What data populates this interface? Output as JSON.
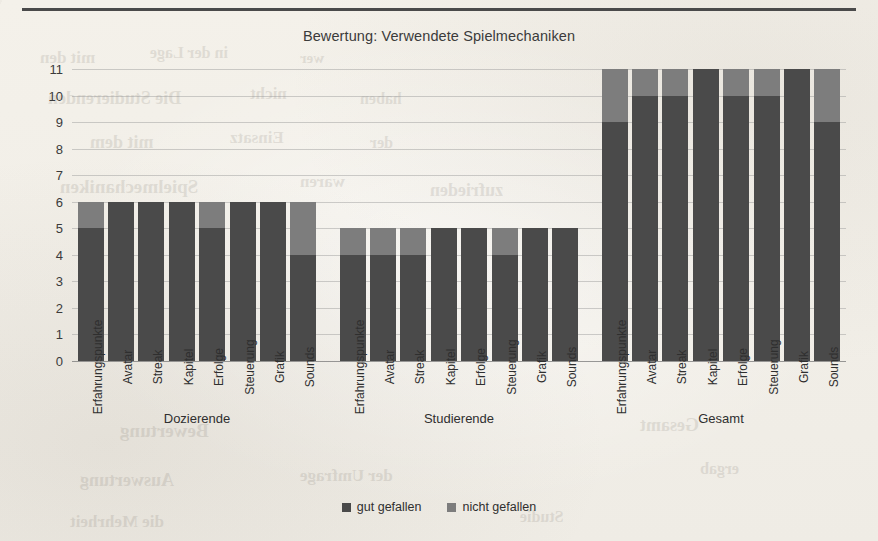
{
  "chart_data": {
    "type": "bar",
    "subtype": "stacked-column",
    "title": "Bewertung: Verwendete Spielmechaniken",
    "xlabel": "",
    "ylabel": "",
    "ylim": [
      0,
      11
    ],
    "ytick_labels": [
      "0",
      "1",
      "2",
      "3",
      "4",
      "5",
      "6",
      "7",
      "8",
      "9",
      "10",
      "11"
    ],
    "grid": true,
    "legend_position": "bottom",
    "categories": [
      "Erfahrungspunkte",
      "Avatar",
      "Streak",
      "Kapitel",
      "Erfolge",
      "Steuerung",
      "Grafik",
      "Sounds"
    ],
    "groups": [
      {
        "name": "Dozierende",
        "total": 6,
        "series": [
          {
            "name": "gut gefallen",
            "values": [
              5,
              6,
              6,
              6,
              5,
              6,
              6,
              4
            ]
          },
          {
            "name": "nicht gefallen",
            "values": [
              1,
              0,
              0,
              0,
              1,
              0,
              0,
              2
            ]
          }
        ]
      },
      {
        "name": "Studierende",
        "total": 5,
        "series": [
          {
            "name": "gut gefallen",
            "values": [
              4,
              4,
              4,
              5,
              5,
              4,
              5,
              5
            ]
          },
          {
            "name": "nicht gefallen",
            "values": [
              1,
              1,
              1,
              0,
              0,
              1,
              0,
              0
            ]
          }
        ]
      },
      {
        "name": "Gesamt",
        "total": 11,
        "series": [
          {
            "name": "gut gefallen",
            "values": [
              9,
              10,
              10,
              11,
              10,
              10,
              11,
              9
            ]
          },
          {
            "name": "nicht gefallen",
            "values": [
              2,
              1,
              1,
              0,
              1,
              1,
              0,
              2
            ]
          }
        ]
      }
    ],
    "series_colors": {
      "gut gefallen": "#4a4a4a",
      "nicht gefallen": "#7d7d7d"
    }
  },
  "legend": {
    "items": [
      {
        "label": "gut gefallen",
        "color": "#4a4a4a"
      },
      {
        "label": "nicht gefallen",
        "color": "#7d7d7d"
      }
    ]
  },
  "background_bleed": [
    {
      "text": "mit den",
      "x": 40,
      "y": 48,
      "size": 17
    },
    {
      "text": "in der Lage",
      "x": 150,
      "y": 44,
      "size": 16
    },
    {
      "text": "wer",
      "x": 300,
      "y": 50,
      "size": 15
    },
    {
      "text": "Die Studierenden",
      "x": 48,
      "y": 88,
      "size": 18
    },
    {
      "text": "nicht",
      "x": 250,
      "y": 84,
      "size": 17
    },
    {
      "text": "haben",
      "x": 360,
      "y": 90,
      "size": 16
    },
    {
      "text": "mit dem",
      "x": 90,
      "y": 132,
      "size": 18
    },
    {
      "text": "Einsatz",
      "x": 230,
      "y": 128,
      "size": 17
    },
    {
      "text": "der",
      "x": 370,
      "y": 134,
      "size": 16
    },
    {
      "text": "Spielmechaniken",
      "x": 60,
      "y": 176,
      "size": 19
    },
    {
      "text": "waren",
      "x": 300,
      "y": 172,
      "size": 17
    },
    {
      "text": "zufrieden",
      "x": 430,
      "y": 180,
      "size": 18
    },
    {
      "text": "Bewertung",
      "x": 120,
      "y": 420,
      "size": 19
    },
    {
      "text": "Gesamt",
      "x": 640,
      "y": 415,
      "size": 18
    },
    {
      "text": "Auswertung",
      "x": 80,
      "y": 470,
      "size": 18
    },
    {
      "text": "der Umfrage",
      "x": 300,
      "y": 466,
      "size": 17
    },
    {
      "text": "ergab",
      "x": 700,
      "y": 460,
      "size": 16
    },
    {
      "text": "die Mehrheit",
      "x": 70,
      "y": 512,
      "size": 17
    },
    {
      "text": "Studie",
      "x": 520,
      "y": 508,
      "size": 16
    }
  ]
}
